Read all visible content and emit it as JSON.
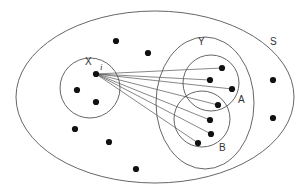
{
  "diagram": {
    "type": "set-venn",
    "colors": {
      "stroke": "#555555",
      "dot": "#111111",
      "background": "#ffffff"
    },
    "sets": [
      {
        "id": "S",
        "label": "S",
        "shape": "ellipse",
        "cx": 155,
        "cy": 97,
        "rx": 139,
        "ry": 86,
        "label_pos": [
          273,
          45
        ]
      },
      {
        "id": "X",
        "label": "X",
        "shape": "circle",
        "cx": 90,
        "cy": 88,
        "r": 30,
        "label_pos": [
          86,
          65
        ]
      },
      {
        "id": "Y",
        "label": "Y",
        "shape": "ellipse",
        "cx": 205,
        "cy": 103,
        "rx": 49,
        "ry": 66,
        "label_pos": [
          199,
          45
        ]
      },
      {
        "id": "A",
        "label": "A",
        "shape": "circle",
        "cx": 211,
        "cy": 83,
        "r": 28,
        "label_pos": [
          239,
          103
        ]
      },
      {
        "id": "B",
        "label": "B",
        "shape": "circle",
        "cx": 202,
        "cy": 119,
        "r": 28,
        "label_pos": [
          220,
          151
        ]
      }
    ],
    "source_point": {
      "label": "i",
      "x": 96,
      "y": 74,
      "label_pos": [
        100,
        70
      ]
    },
    "points_in_X": [
      [
        77,
        90
      ],
      [
        96,
        102
      ]
    ],
    "points_in_Y": [
      [
        222,
        68
      ],
      [
        210,
        80
      ],
      [
        232,
        89
      ],
      [
        218,
        105
      ],
      [
        210,
        120
      ],
      [
        211,
        134
      ],
      [
        198,
        143
      ]
    ],
    "points_outside": [
      [
        116,
        41
      ],
      [
        148,
        53
      ],
      [
        75,
        129
      ],
      [
        109,
        142
      ],
      [
        136,
        169
      ],
      [
        273,
        80
      ],
      [
        273,
        118
      ]
    ],
    "labels": {
      "S": "S",
      "X": "X",
      "Y": "Y",
      "A": "A",
      "B": "B",
      "i": "i"
    }
  }
}
